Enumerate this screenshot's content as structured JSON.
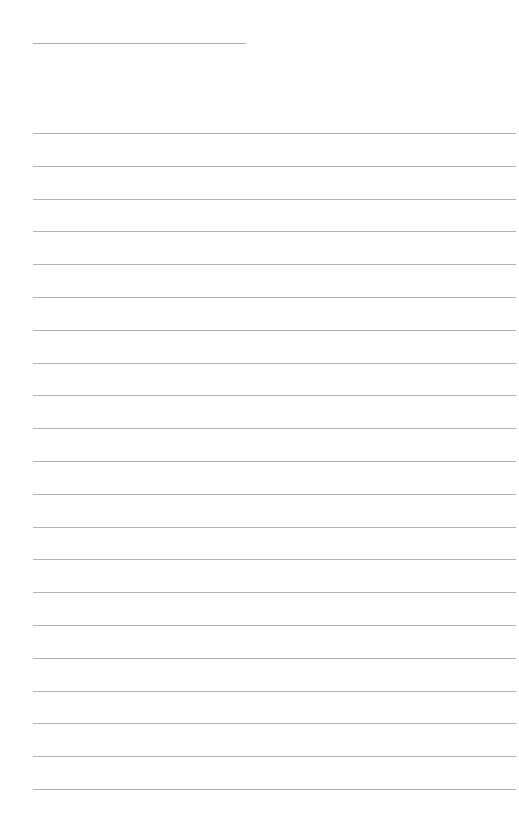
{
  "page": {
    "type": "blank-lined-paper",
    "title_text": "",
    "background_color": "#ffffff",
    "line_color": "#b3b3b3",
    "title_line": {
      "x": 33,
      "y": 43,
      "width": 213
    },
    "rules": {
      "count": 21,
      "x": 33,
      "width": 483,
      "first_y": 133,
      "spacing": 32.8
    },
    "lines": []
  }
}
